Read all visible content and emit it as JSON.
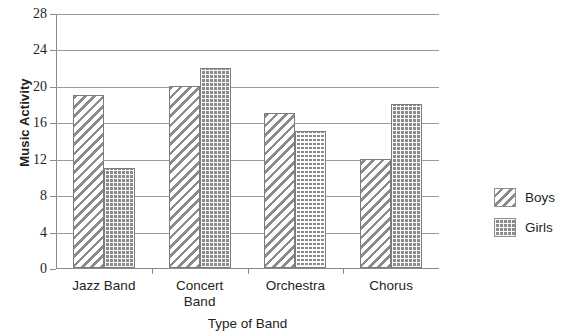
{
  "chart_data": {
    "type": "bar",
    "title": "",
    "xlabel": "Type of Band",
    "ylabel": "Music Activity",
    "categories": [
      "Jazz Band",
      "Concert\nBand",
      "Orchestra",
      "Chorus"
    ],
    "ylim": [
      0,
      28
    ],
    "yticks": [
      0,
      4,
      8,
      12,
      16,
      20,
      24,
      28
    ],
    "grid": true,
    "legend_position": "right",
    "series": [
      {
        "name": "Boys",
        "values": [
          19,
          20,
          17,
          12
        ],
        "pattern": "diagonal-hatch",
        "color": "#8b8b8b"
      },
      {
        "name": "Girls",
        "values": [
          11,
          22,
          15,
          18
        ],
        "pattern": "cross-dot",
        "color": "#8b8b8b"
      }
    ]
  },
  "legend": {
    "items": [
      {
        "label": "Boys"
      },
      {
        "label": "Girls"
      }
    ]
  }
}
